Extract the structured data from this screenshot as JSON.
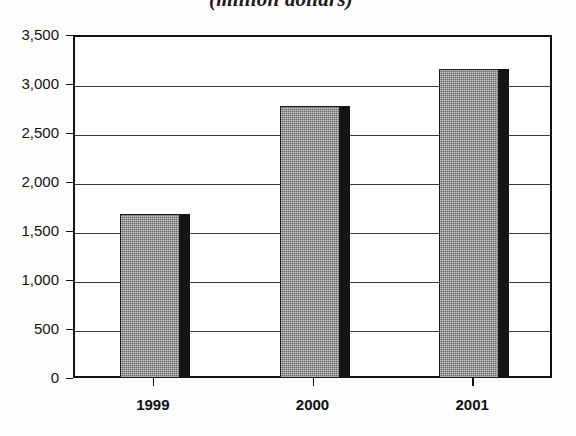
{
  "chart_data": {
    "type": "bar",
    "title": "(million dollars)",
    "xlabel": "",
    "ylabel": "",
    "categories": [
      "1999",
      "2000",
      "2001"
    ],
    "values": [
      1670,
      2780,
      3150
    ],
    "ylim": [
      0,
      3500
    ],
    "ytick_labels": [
      "3,500",
      "3,000",
      "2,500",
      "2,000",
      "1,500",
      "1,000",
      "500",
      "0"
    ],
    "ytick_values": [
      3500,
      3000,
      2500,
      2000,
      1500,
      1000,
      500,
      0
    ],
    "grid": true,
    "legend": "none",
    "series": [
      {
        "name": "(million dollars)",
        "values": [
          1670,
          2780,
          3150
        ]
      }
    ],
    "colors": {
      "bar_fill": "#8e8e8e",
      "bar_shadow": "#141414",
      "axis": "#111111",
      "grid": "#3a3a3a",
      "background": "#ffffff"
    }
  }
}
